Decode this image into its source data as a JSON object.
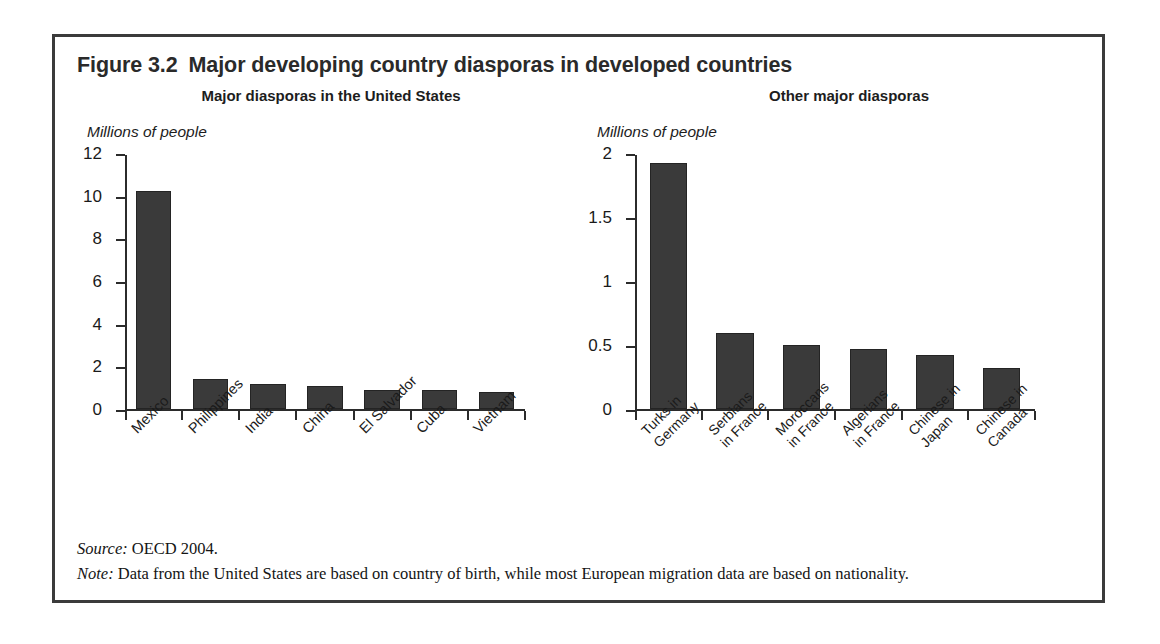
{
  "figure": {
    "number": "Figure 3.2",
    "title": "Major developing country diasporas in developed countries",
    "source_label": "Source:",
    "source_text": " OECD 2004.",
    "note_label": "Note:",
    "note_text": " Data from the United States are based on country of birth, while most European migration data are based on nationality.",
    "frame_color": "#3b3b3b",
    "bar_color": "#3a3a3a",
    "axis_color": "#2b2b2b"
  },
  "chart_data": [
    {
      "type": "bar",
      "title": "Major diasporas in the United States",
      "xlabel": "",
      "ylabel": "Millions of people",
      "categories": [
        "Mexico",
        "Philippines",
        "India",
        "China",
        "El Salvador",
        "Cuba",
        "Vietnam"
      ],
      "values": [
        10.2,
        1.4,
        1.15,
        1.1,
        0.9,
        0.88,
        0.82
      ],
      "yticks": [
        "0",
        "2",
        "4",
        "6",
        "8",
        "10",
        "12"
      ],
      "ytick_values": [
        0,
        2,
        4,
        6,
        8,
        10,
        12
      ],
      "ylim": [
        0,
        12
      ],
      "grid": false,
      "legend": "none"
    },
    {
      "type": "bar",
      "title": "Other major diasporas",
      "xlabel": "",
      "ylabel": "Millions of people",
      "categories": [
        "Turks in\nGermany",
        "Serbians\nin France",
        "Moroccans\nin France",
        "Algerians\nin France",
        "Chinese in\nJapan",
        "Chinese in\nCanada"
      ],
      "values": [
        1.92,
        0.59,
        0.5,
        0.47,
        0.42,
        0.32
      ],
      "yticks": [
        "0",
        "0.5",
        "1",
        "1.5",
        "2"
      ],
      "ytick_values": [
        0,
        0.5,
        1,
        1.5,
        2
      ],
      "ylim": [
        0,
        2
      ],
      "grid": false,
      "legend": "none"
    }
  ]
}
